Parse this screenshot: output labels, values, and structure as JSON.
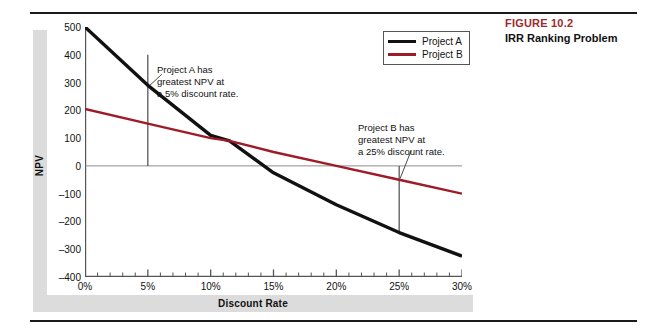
{
  "figure": {
    "number": "FIGURE 10.2",
    "title": "IRR Ranking Problem",
    "number_color": "#9e2a2b"
  },
  "legend": {
    "position": "top-right-inside",
    "entries": [
      {
        "label": "Project A",
        "color": "#111111"
      },
      {
        "label": "Project B",
        "color": "#9e1b28"
      }
    ]
  },
  "axes": {
    "ylabel": "NPV",
    "xlabel": "Discount Rate",
    "yticks": [
      "500",
      "400",
      "300",
      "200",
      "100",
      "0",
      "–100",
      "–200",
      "–300",
      "–400"
    ],
    "xticks": [
      "0%",
      "5%",
      "10%",
      "15%",
      "20%",
      "25%",
      "30%"
    ]
  },
  "annotations": [
    {
      "name": "annotation-project-a",
      "lines": [
        "Project A has",
        "greatest NPV at",
        "a 5% discount rate."
      ],
      "callout_x_percent": 5
    },
    {
      "name": "annotation-project-b",
      "lines": [
        "Project B has",
        "greatest NPV at",
        "a 25% discount rate."
      ],
      "callout_x_percent": 25
    }
  ],
  "chart_data": {
    "type": "line",
    "title": "IRR Ranking Problem",
    "xlabel": "Discount Rate",
    "ylabel": "NPV",
    "xlim": [
      0,
      30
    ],
    "ylim": [
      -400,
      500
    ],
    "x_tick_values": [
      0,
      5,
      10,
      15,
      20,
      25,
      30
    ],
    "x_tick_labels": [
      "0%",
      "5%",
      "10%",
      "15%",
      "20%",
      "25%",
      "30%"
    ],
    "y_tick_values": [
      500,
      400,
      300,
      200,
      100,
      0,
      -100,
      -200,
      -300,
      -400
    ],
    "y_tick_labels": [
      "500",
      "400",
      "300",
      "200",
      "100",
      "0",
      "–100",
      "–200",
      "–300",
      "–400"
    ],
    "x_minor_tick_step": 1,
    "grid": false,
    "zero_line": true,
    "series": [
      {
        "name": "Project A",
        "color": "#111111",
        "x": [
          0,
          5,
          10,
          11.5,
          15,
          20,
          25,
          30
        ],
        "values": [
          500,
          290,
          110,
          90,
          -25,
          -140,
          -240,
          -325
        ]
      },
      {
        "name": "Project B",
        "color": "#9e1b28",
        "x": [
          0,
          5,
          10,
          11.5,
          15,
          20,
          25,
          30
        ],
        "values": [
          205,
          152,
          100,
          90,
          50,
          0,
          -50,
          -100
        ]
      }
    ],
    "annotations": [
      {
        "text": "Project A has greatest NPV at a 5% discount rate.",
        "x": 5
      },
      {
        "text": "Project B has greatest NPV at a 25% discount rate.",
        "x": 25
      }
    ],
    "crossover": {
      "x": 11.5,
      "y": 90
    }
  }
}
